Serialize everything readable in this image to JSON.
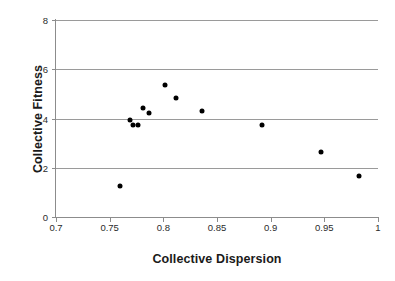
{
  "chart_data": {
    "type": "scatter",
    "title": "",
    "xlabel": "Collective Dispersion",
    "ylabel": "Collective Fitness",
    "xlim": [
      0.7,
      1
    ],
    "ylim": [
      0,
      8
    ],
    "xticks": [
      "0.7",
      "0.75",
      "0.8",
      "0.85",
      "0.9",
      "0.95",
      "1"
    ],
    "xtick_values": [
      0.7,
      0.75,
      0.8,
      0.85,
      0.9,
      0.95,
      1
    ],
    "yticks": [
      "0",
      "2",
      "4",
      "6",
      "8"
    ],
    "ytick_values": [
      0,
      2,
      4,
      6,
      8
    ],
    "grid": "horizontal",
    "legend": "none",
    "marker": "diamond-filled-black",
    "marker_color": "#000000",
    "points": [
      {
        "x": 0.76,
        "y": 1.25
      },
      {
        "x": 0.769,
        "y": 3.94
      },
      {
        "x": 0.772,
        "y": 3.72
      },
      {
        "x": 0.776,
        "y": 3.72
      },
      {
        "x": 0.781,
        "y": 4.43
      },
      {
        "x": 0.787,
        "y": 4.23
      },
      {
        "x": 0.802,
        "y": 5.35
      },
      {
        "x": 0.812,
        "y": 4.85
      },
      {
        "x": 0.836,
        "y": 4.3
      },
      {
        "x": 0.892,
        "y": 3.75
      },
      {
        "x": 0.947,
        "y": 2.63
      },
      {
        "x": 0.982,
        "y": 1.67
      }
    ]
  }
}
